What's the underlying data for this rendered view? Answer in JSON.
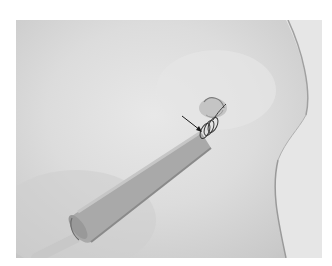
{
  "image": {
    "kind": "grayscale clinical photograph",
    "subject": "drainage tube inserted through skin, secured with suture",
    "annotation": "arrow pointing to suture",
    "colors": {
      "margin": "#ffffff",
      "skin": "#dcdcdc",
      "tube": "#a8a8a8",
      "tube_shadow": "#8a8a8a",
      "drape": "#e4e4e4",
      "suture": "#3a3a3a"
    }
  }
}
